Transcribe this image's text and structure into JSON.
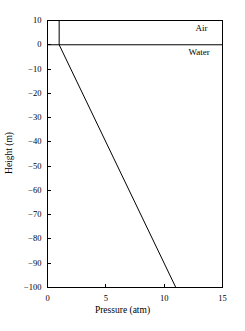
{
  "chart_data": {
    "type": "line",
    "title": "",
    "xlabel": "Pressure (atm)",
    "ylabel": "Height (m)",
    "xlim": [
      0,
      15
    ],
    "ylim": [
      -100,
      10
    ],
    "xticks": [
      0,
      5,
      10,
      15
    ],
    "yticks": [
      10,
      0,
      -10,
      -20,
      -30,
      -40,
      -50,
      -60,
      -70,
      -80,
      -90,
      -100
    ],
    "xtick_labels": [
      "0",
      "5",
      "10",
      "15"
    ],
    "ytick_labels": [
      "10",
      "0",
      "−10",
      "−20",
      "−30",
      "−40",
      "−50",
      "−60",
      "−70",
      "−80",
      "−90",
      "−100"
    ],
    "grid": false,
    "legend_position": "none",
    "line_color": "#000000",
    "frame_color": "#000000",
    "background_color": "#ffffff",
    "series": [
      {
        "name": "Air",
        "comment": "Near-constant atmospheric pressure above the water surface",
        "x": [
          1,
          1
        ],
        "y": [
          10,
          0
        ]
      },
      {
        "name": "Water",
        "comment": "Hydrostatic pressure increases ~1 atm per 10 m of depth",
        "x": [
          1,
          11
        ],
        "y": [
          0,
          -100
        ]
      },
      {
        "name": "Air-water interface",
        "comment": "Horizontal boundary line drawn at height 0 across the full plot width",
        "x": [
          0,
          15
        ],
        "y": [
          0,
          0
        ]
      }
    ],
    "annotations": [
      {
        "text": "Air",
        "x": 13.2,
        "y": 6.5,
        "region": "above-interface"
      },
      {
        "text": "Water",
        "x": 13.0,
        "y": -3.5,
        "region": "below-interface"
      }
    ]
  },
  "axes": {
    "x_title": "Pressure (atm)",
    "y_title": "Height (m)"
  },
  "labels": {
    "air": "Air",
    "water": "Water"
  },
  "ticks": {
    "y": [
      "10",
      "0",
      "−10",
      "−20",
      "−30",
      "−40",
      "−50",
      "−60",
      "−70",
      "−80",
      "−90",
      "−100"
    ],
    "x": [
      "0",
      "5",
      "10",
      "15"
    ]
  }
}
